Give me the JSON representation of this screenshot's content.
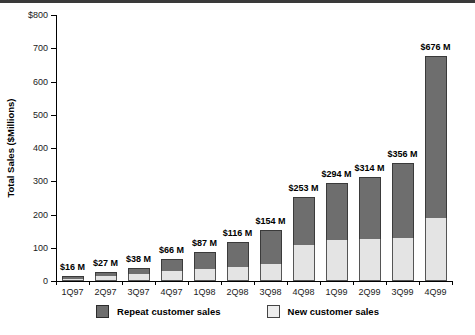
{
  "chart_data": {
    "type": "bar",
    "stacked": true,
    "title": "",
    "xlabel": "",
    "ylabel": "Total Sales ($Millions)",
    "ylim": [
      0,
      800
    ],
    "yticks": [
      0,
      100,
      200,
      300,
      400,
      500,
      600,
      700,
      800
    ],
    "ytick_labels": [
      "0",
      "100",
      "200",
      "300",
      "400",
      "500",
      "600",
      "700",
      "$800"
    ],
    "grid": false,
    "legend_position": "bottom",
    "categories": [
      "1Q97",
      "2Q97",
      "3Q97",
      "4Q97",
      "1Q98",
      "2Q98",
      "3Q98",
      "4Q98",
      "1Q99",
      "2Q99",
      "3Q99",
      "4Q99"
    ],
    "series": [
      {
        "name": "New customer sales",
        "color": "#e4e4e4",
        "values": [
          7,
          14,
          20,
          30,
          36,
          43,
          51,
          107,
          124,
          125,
          130,
          190
        ]
      },
      {
        "name": "Repeat customer sales",
        "color": "#6e6e6e",
        "values": [
          9,
          13,
          18,
          36,
          51,
          73,
          103,
          146,
          170,
          189,
          226,
          486
        ]
      }
    ],
    "totals": [
      16,
      27,
      38,
      66,
      87,
      116,
      154,
      253,
      294,
      314,
      356,
      676
    ],
    "total_labels": [
      "$16 M",
      "$27 M",
      "$38 M",
      "$66 M",
      "$87 M",
      "$116 M",
      "$154 M",
      "$253 M",
      "$294 M",
      "$314 M",
      "$356 M",
      "$676 M"
    ]
  },
  "legend": {
    "items": [
      {
        "label": "Repeat customer sales",
        "swatch": "repeat-swatch"
      },
      {
        "label": "New customer sales",
        "swatch": "new-swatch"
      }
    ]
  }
}
